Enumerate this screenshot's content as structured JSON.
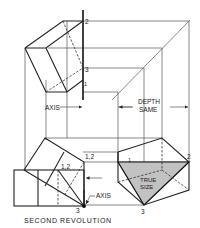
{
  "figure": {
    "caption": "SECOND REVOLUTION",
    "labels": {
      "axis_top": "AXIS",
      "axis_bottom": "AXIS",
      "depth_line1": "DEPTH",
      "depth_line2": "SAME",
      "true_size_line1": "TRUE",
      "true_size_line2": "SIZE",
      "top_pt2": "2",
      "top_pt3": "3",
      "top_pt1": "1",
      "front_pt12_outer": "1,2",
      "front_pt12_inner": "1,2",
      "front_pt3": "3",
      "side_pt1": "1",
      "side_pt2": "2",
      "side_pt3": "3"
    },
    "colors": {
      "line": "#222222",
      "projection": "#555555",
      "true_size_fill": "#c8c8c8"
    }
  }
}
